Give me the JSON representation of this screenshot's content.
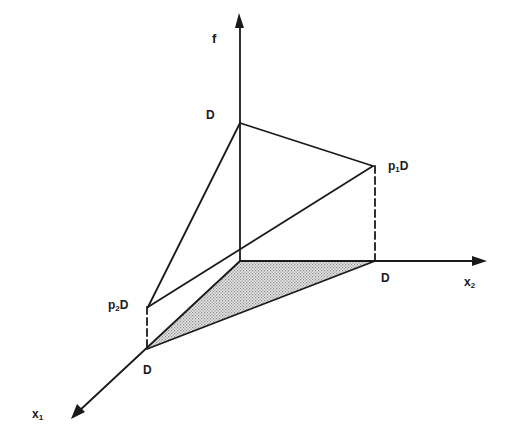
{
  "figure": {
    "type": "3D axonometric diagram",
    "axes": {
      "f": {
        "label": "f",
        "sub": ""
      },
      "x1": {
        "label": "x",
        "sub": "1"
      },
      "x2": {
        "label": "x",
        "sub": "2"
      }
    },
    "points": {
      "f_intercept": {
        "label": "D"
      },
      "x2_intercept": {
        "label": "D"
      },
      "x1_intercept": {
        "label": "D"
      },
      "p1D": {
        "prefix": "p",
        "sub": "1",
        "suffix": "D"
      },
      "p2D": {
        "prefix": "p",
        "sub": "2",
        "suffix": "D"
      }
    },
    "shaded_region": "triangle in x1-x2 plane between origin, x1 intercept D, and x2 intercept D",
    "colors": {
      "line": "#1a1a1a",
      "shading": "#bdbdbd"
    }
  }
}
